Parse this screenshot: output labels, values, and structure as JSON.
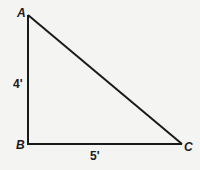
{
  "diagram": {
    "type": "right-triangle",
    "vertices": [
      {
        "id": "A",
        "label": "A",
        "x": 28,
        "y": 15
      },
      {
        "id": "B",
        "label": "B",
        "x": 28,
        "y": 144
      },
      {
        "id": "C",
        "label": "C",
        "x": 182,
        "y": 144
      }
    ],
    "sides": [
      {
        "from": "A",
        "to": "B",
        "label": "4'"
      },
      {
        "from": "B",
        "to": "C",
        "label": "5'"
      },
      {
        "from": "A",
        "to": "C",
        "label": ""
      }
    ],
    "line_color": "#1a1a1a",
    "background": "#f4f4f2"
  }
}
